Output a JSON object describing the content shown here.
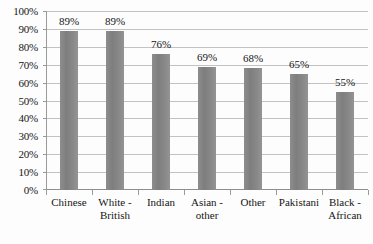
{
  "chart_data": {
    "type": "bar",
    "title": "",
    "subtitle": "",
    "xlabel": "",
    "ylabel": "",
    "categories": [
      "Chinese",
      "White - British",
      "Indian",
      "Asian - other",
      "Other",
      "Pakistani",
      "Black - African"
    ],
    "category_lines": [
      [
        "Chinese"
      ],
      [
        "White -",
        "British"
      ],
      [
        "Indian"
      ],
      [
        "Asian -",
        "other"
      ],
      [
        "Other"
      ],
      [
        "Pakistani"
      ],
      [
        "Black -",
        "African"
      ]
    ],
    "values": [
      89,
      89,
      76,
      69,
      68,
      65,
      55
    ],
    "data_labels": [
      "89%",
      "89%",
      "76%",
      "69%",
      "68%",
      "65%",
      "55%"
    ],
    "ylim": [
      0,
      100
    ],
    "ytick_values": [
      0,
      10,
      20,
      30,
      40,
      50,
      60,
      70,
      80,
      90,
      100
    ],
    "ytick_labels": [
      "0%",
      "10%",
      "20%",
      "30%",
      "40%",
      "50%",
      "60%",
      "70%",
      "80%",
      "90%",
      "100%"
    ],
    "grid": true,
    "grid_axis": "y",
    "legend": false,
    "legend_position": "none",
    "bar_color": "#858585",
    "gridline_color": "#c2c2c2",
    "axis_color": "#9a9a9a",
    "background_color": "#fdfdfd",
    "text_color": "#161616"
  }
}
